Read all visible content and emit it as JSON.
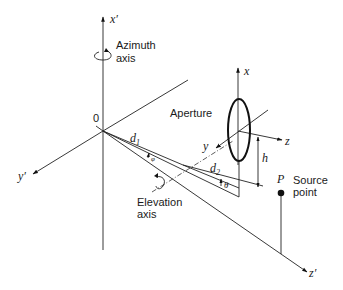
{
  "figure": {
    "type": "3D geometry diagram"
  },
  "axes": {
    "primed": {
      "x": "x′",
      "y": "y′",
      "z": "z′"
    },
    "aperture": {
      "x": "x",
      "y": "y",
      "z": "z"
    }
  },
  "labels": {
    "origin": "0",
    "azimuth_line1": "Azimuth",
    "azimuth_line2": "axis",
    "elevation_line1": "Elevation",
    "elevation_line2": "axis",
    "aperture": "Aperture",
    "d1": "d",
    "d1_sub": "1",
    "d2": "d",
    "d2_sub": "2",
    "phi": "φ",
    "theta": "θ",
    "h": "h",
    "P": "P",
    "source_line1": "Source",
    "source_line2": "point"
  },
  "colors": {
    "stroke": "#222222",
    "background": "#ffffff"
  }
}
